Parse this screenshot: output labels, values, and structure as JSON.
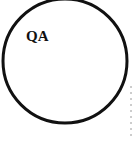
{
  "diagram": {
    "type": "venn-circle",
    "circle": {
      "label": "QA",
      "stroke_color": "#111111",
      "fill_color": "#ffffff"
    },
    "guide_line": {
      "style": "dashed",
      "color": "#9a9a9a"
    }
  }
}
